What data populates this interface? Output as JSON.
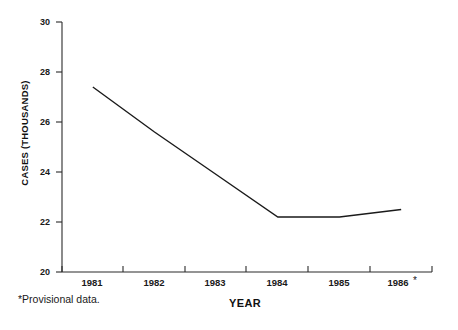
{
  "chart_data": {
    "type": "line",
    "title": "",
    "xlabel": "YEAR",
    "ylabel": "CASES (THOUSANDS)",
    "categories": [
      "1981",
      "1982",
      "1983",
      "1984",
      "1985",
      "1986"
    ],
    "values": [
      27.4,
      25.6,
      23.9,
      22.2,
      22.2,
      22.5
    ],
    "series": [
      {
        "name": "Cases",
        "values": [
          27.4,
          25.6,
          23.9,
          22.2,
          22.2,
          22.5
        ]
      }
    ],
    "ylim": [
      20,
      30
    ],
    "y_ticks": [
      20,
      22,
      24,
      26,
      28,
      30
    ],
    "y_tick_labels": [
      "20",
      "22",
      "24",
      "26",
      "28",
      "30"
    ],
    "x_tick_labels": [
      "1981",
      "1982",
      "1983",
      "1984",
      "1985",
      "1986"
    ],
    "grid": false,
    "legend": false,
    "legend_position": "none",
    "line_color": "#1a1a1a",
    "axis_color": "#2b2b2b",
    "background_color": "#ffffff",
    "annotations": {
      "last_category_marker": "*",
      "footnote": "*Provisional data."
    }
  }
}
